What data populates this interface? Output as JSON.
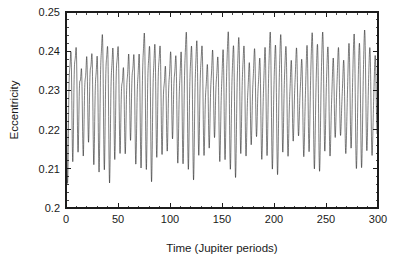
{
  "chart_data": {
    "type": "line",
    "title": "",
    "xlabel": "Time (Jupiter periods)",
    "ylabel": "Eccentricity",
    "xlim": [
      0,
      300
    ],
    "ylim": [
      0.2,
      0.25
    ],
    "xticks": [
      0,
      50,
      100,
      150,
      200,
      250,
      300
    ],
    "xtick_labels": [
      "0",
      "50",
      "100",
      "150",
      "200",
      "250",
      "300"
    ],
    "yticks": [
      0.2,
      0.21,
      0.22,
      0.23,
      0.24,
      0.25
    ],
    "ytick_labels": [
      "0.2",
      "0.21",
      "0.22",
      "0.23",
      "0.24",
      "0.25"
    ],
    "x_minor_interval": 10,
    "y_minor_interval": 0.002,
    "grid": false,
    "legend": null,
    "series_name": "eccentricity",
    "line_color": "#141414",
    "background_color": "#ffffff",
    "axis_color": "#1c1c1c",
    "mean_level": 0.2285,
    "observed_min": 0.2068,
    "observed_max": 0.2472,
    "fast_period": 5.0,
    "envelope_period": 41.0,
    "sample_count": 3000,
    "model": {
      "base": 0.2285,
      "fast_amplitude": 0.0152,
      "fast_period": 5.05,
      "fast_phase": 1.15,
      "beat_amplitude": 0.0038,
      "beat_period": 40.7,
      "beat_phase": 0.4,
      "secondary_amplitude": 0.0046,
      "secondary_period": 2.52,
      "secondary_phase": 0.0,
      "slow_amplitude": 0.0022,
      "slow_period": 13.3,
      "slow_phase": 2.1,
      "skew": 0.34
    }
  },
  "axis_labels": {
    "x": "Time (Jupiter periods)",
    "y": "Eccentricity"
  }
}
